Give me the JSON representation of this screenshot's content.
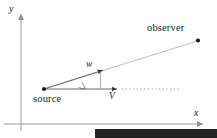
{
  "figure": {
    "type": "vector-diagram",
    "background_color": "#ffffff",
    "line_color": "#9a9a9a",
    "dark_color": "#232323",
    "width": 217,
    "height": 138
  },
  "axes": {
    "x_label": "x",
    "y_label": "y",
    "origin": {
      "x": 21,
      "y": 124
    },
    "x_axis": {
      "start_x": 5,
      "end_x": 205,
      "y": 124,
      "arrow": "right"
    },
    "y_axis": {
      "x": 21,
      "start_y": 130,
      "end_y": 12,
      "arrow": "up"
    }
  },
  "points": [
    {
      "name": "source",
      "label": "source",
      "x": 44,
      "y": 89,
      "label_x": 33,
      "label_y": 94
    },
    {
      "name": "observer",
      "label": "observer",
      "x": 198,
      "y": 40,
      "label_x": 147,
      "label_y": 23
    }
  ],
  "vectors": [
    {
      "name": "w",
      "label": "w",
      "accent": "vector-arrow",
      "from_x": 44,
      "from_y": 89,
      "to_x": 106,
      "to_y": 69,
      "label_x": 86,
      "label_y": 60
    },
    {
      "name": "V",
      "label": "V",
      "accent": "vector-arrow",
      "from_x": 44,
      "from_y": 89,
      "to_x": 120,
      "to_y": 89,
      "label_x": 109,
      "label_y": 92
    }
  ],
  "sight_line": {
    "name": "line-of-sight",
    "from_x": 44,
    "from_y": 89,
    "to_x": 197,
    "to_y": 41
  },
  "dotted_line": {
    "name": "horizontal-dotted-extension",
    "from_x": 122,
    "from_y": 89,
    "to_x": 179,
    "to_y": 89
  },
  "angle_mark": {
    "name": "angle-between-v-and-w",
    "vertex_x": 44,
    "vertex_y": 89,
    "radius": 40,
    "label": ""
  }
}
